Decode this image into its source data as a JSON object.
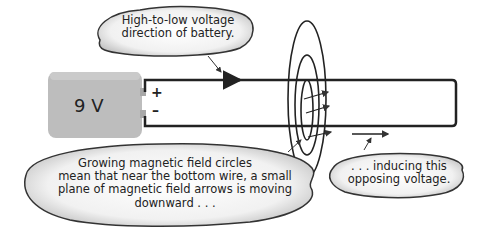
{
  "diagram": {
    "battery": {
      "label": "9 V",
      "plus_terminal": "+",
      "minus_terminal": "–",
      "color": "#bdbdbd"
    },
    "callouts": {
      "top": {
        "lines": [
          "High-to-low voltage",
          "direction of battery."
        ]
      },
      "bottom_left": {
        "lines": [
          "Growing magnetic field circles",
          "mean that near the bottom wire, a small",
          "plane of magnetic field arrows is moving",
          "downward . . ."
        ]
      },
      "bottom_right": {
        "lines": [
          ". . . inducing this",
          "opposing voltage."
        ]
      }
    },
    "elements": {
      "circuit_loop": "rectangular wire loop",
      "magnetic_field_rings": 3,
      "field_arrows": 3,
      "induced_voltage_arrow": "rightward arrow below bottom wire"
    },
    "colors": {
      "wire": "#222222",
      "bubble_fill": "#e6e6e6",
      "bubble_edge": "#333333"
    }
  }
}
